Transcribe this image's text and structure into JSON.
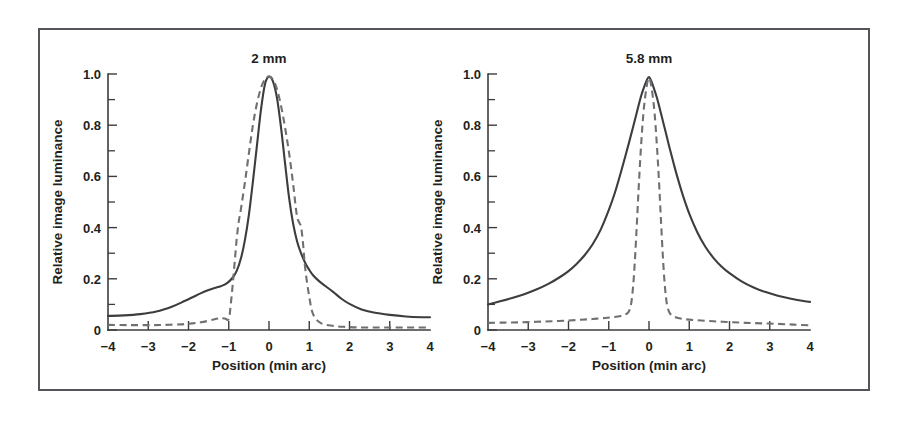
{
  "figure": {
    "frame_color": "#53555a",
    "background": "#ffffff",
    "solid_color": "#3d3d3f",
    "dashed_color": "#6e7073"
  },
  "chart_data": [
    {
      "type": "line",
      "title": "2 mm",
      "xlabel": "Position (min arc)",
      "ylabel": "Relative image luminance",
      "xlim": [
        -4,
        4
      ],
      "ylim": [
        0,
        1.0
      ],
      "grid": false,
      "legend": "none",
      "xticks": [
        -4,
        -3,
        -2,
        -1,
        0,
        1,
        2,
        3,
        4
      ],
      "xticklabels": [
        "−4",
        "−3",
        "−2",
        "−1",
        "0",
        "1",
        "2",
        "3",
        "4"
      ],
      "yticks": [
        0,
        0.1,
        0.2,
        0.3,
        0.4,
        0.5,
        0.6,
        0.7,
        0.8,
        0.9,
        1.0
      ],
      "yticklabels": [
        "0",
        "",
        "0.2",
        "",
        "0.4",
        "",
        "0.6",
        "",
        "0.8",
        "",
        "1.0"
      ],
      "series": [
        {
          "name": "solid",
          "style": "solid",
          "x": [
            -4.0,
            -3.6,
            -3.2,
            -2.8,
            -2.4,
            -2.1,
            -1.9,
            -1.7,
            -1.5,
            -1.35,
            -1.2,
            -1.05,
            -0.9,
            -0.8,
            -0.7,
            -0.6,
            -0.5,
            -0.4,
            -0.3,
            -0.2,
            -0.1,
            0.0,
            0.1,
            0.2,
            0.3,
            0.4,
            0.5,
            0.6,
            0.7,
            0.8,
            0.9,
            1.0,
            1.1,
            1.25,
            1.4,
            1.6,
            1.8,
            2.0,
            2.3,
            2.6,
            3.0,
            3.4,
            3.8,
            4.0
          ],
          "y": [
            0.055,
            0.057,
            0.062,
            0.072,
            0.092,
            0.113,
            0.128,
            0.143,
            0.156,
            0.164,
            0.171,
            0.182,
            0.205,
            0.232,
            0.278,
            0.35,
            0.45,
            0.58,
            0.72,
            0.86,
            0.96,
            0.99,
            0.97,
            0.905,
            0.79,
            0.65,
            0.515,
            0.415,
            0.345,
            0.298,
            0.262,
            0.235,
            0.213,
            0.19,
            0.172,
            0.148,
            0.122,
            0.102,
            0.08,
            0.068,
            0.059,
            0.053,
            0.05,
            0.05
          ]
        },
        {
          "name": "dashed",
          "style": "dashed",
          "x": [
            -4.0,
            -3.5,
            -3.0,
            -2.6,
            -2.2,
            -1.9,
            -1.7,
            -1.5,
            -1.35,
            -1.25,
            -1.2,
            -1.1,
            -1.0,
            -0.95,
            -0.9,
            -0.85,
            -0.8,
            -0.75,
            -0.7,
            -0.6,
            -0.5,
            -0.4,
            -0.3,
            -0.2,
            -0.1,
            0.0,
            0.1,
            0.2,
            0.3,
            0.4,
            0.5,
            0.6,
            0.65,
            0.7,
            0.75,
            0.8,
            0.85,
            0.9,
            1.0,
            1.1,
            1.3,
            1.6,
            1.9,
            2.2,
            2.6,
            3.0,
            3.4,
            3.8,
            4.0
          ],
          "y": [
            0.02,
            0.019,
            0.019,
            0.02,
            0.022,
            0.026,
            0.03,
            0.036,
            0.042,
            0.045,
            0.046,
            0.045,
            0.043,
            0.1,
            0.18,
            0.27,
            0.36,
            0.425,
            0.47,
            0.575,
            0.69,
            0.8,
            0.885,
            0.945,
            0.98,
            0.99,
            0.978,
            0.94,
            0.875,
            0.79,
            0.69,
            0.57,
            0.5,
            0.44,
            0.42,
            0.4,
            0.33,
            0.24,
            0.13,
            0.06,
            0.026,
            0.016,
            0.012,
            0.01,
            0.01,
            0.01,
            0.01,
            0.01,
            0.01
          ]
        }
      ]
    },
    {
      "type": "line",
      "title": "5.8 mm",
      "xlabel": "Position (min arc)",
      "ylabel": "Relative image luminance",
      "xlim": [
        -4,
        4
      ],
      "ylim": [
        0,
        1.0
      ],
      "grid": false,
      "legend": "none",
      "xticks": [
        -4,
        -3,
        -2,
        -1,
        0,
        1,
        2,
        3,
        4
      ],
      "xticklabels": [
        "−4",
        "−3",
        "−2",
        "−1",
        "0",
        "1",
        "2",
        "3",
        "4"
      ],
      "yticks": [
        0,
        0.1,
        0.2,
        0.3,
        0.4,
        0.5,
        0.6,
        0.7,
        0.8,
        0.9,
        1.0
      ],
      "yticklabels": [
        "0",
        "",
        "0.2",
        "",
        "0.4",
        "",
        "0.6",
        "",
        "0.8",
        "",
        "1.0"
      ],
      "series": [
        {
          "name": "solid",
          "style": "solid",
          "x": [
            -4.0,
            -3.7,
            -3.4,
            -3.1,
            -2.8,
            -2.5,
            -2.2,
            -2.0,
            -1.8,
            -1.6,
            -1.4,
            -1.2,
            -1.0,
            -0.85,
            -0.7,
            -0.6,
            -0.5,
            -0.4,
            -0.3,
            -0.2,
            -0.12,
            -0.05,
            0.0,
            0.05,
            0.12,
            0.2,
            0.3,
            0.4,
            0.5,
            0.6,
            0.7,
            0.85,
            1.0,
            1.2,
            1.4,
            1.6,
            1.8,
            2.0,
            2.3,
            2.6,
            2.9,
            3.2,
            3.5,
            3.8,
            4.0
          ],
          "y": [
            0.1,
            0.112,
            0.125,
            0.14,
            0.158,
            0.18,
            0.208,
            0.23,
            0.258,
            0.292,
            0.335,
            0.392,
            0.468,
            0.535,
            0.615,
            0.672,
            0.73,
            0.79,
            0.852,
            0.912,
            0.95,
            0.978,
            0.988,
            0.975,
            0.945,
            0.905,
            0.845,
            0.782,
            0.718,
            0.658,
            0.6,
            0.522,
            0.455,
            0.382,
            0.325,
            0.282,
            0.248,
            0.222,
            0.19,
            0.166,
            0.148,
            0.134,
            0.123,
            0.114,
            0.11
          ]
        },
        {
          "name": "dashed",
          "style": "dashed",
          "x": [
            -4.0,
            -3.6,
            -3.2,
            -2.8,
            -2.4,
            -2.0,
            -1.7,
            -1.4,
            -1.1,
            -0.9,
            -0.7,
            -0.6,
            -0.52,
            -0.46,
            -0.42,
            -0.38,
            -0.34,
            -0.3,
            -0.26,
            -0.22,
            -0.18,
            -0.14,
            -0.1,
            -0.06,
            -0.03,
            0.0,
            0.03,
            0.06,
            0.1,
            0.14,
            0.18,
            0.22,
            0.26,
            0.3,
            0.34,
            0.38,
            0.42,
            0.46,
            0.52,
            0.6,
            0.7,
            0.9,
            1.2,
            1.6,
            2.0,
            2.4,
            2.8,
            3.2,
            3.6,
            4.0
          ],
          "y": [
            0.028,
            0.029,
            0.03,
            0.032,
            0.034,
            0.037,
            0.04,
            0.043,
            0.047,
            0.05,
            0.055,
            0.06,
            0.068,
            0.09,
            0.13,
            0.2,
            0.3,
            0.42,
            0.545,
            0.66,
            0.76,
            0.845,
            0.905,
            0.95,
            0.975,
            0.985,
            0.975,
            0.95,
            0.905,
            0.845,
            0.76,
            0.66,
            0.545,
            0.42,
            0.3,
            0.2,
            0.13,
            0.09,
            0.065,
            0.055,
            0.048,
            0.042,
            0.038,
            0.034,
            0.031,
            0.028,
            0.026,
            0.024,
            0.021,
            0.018
          ]
        }
      ]
    }
  ]
}
